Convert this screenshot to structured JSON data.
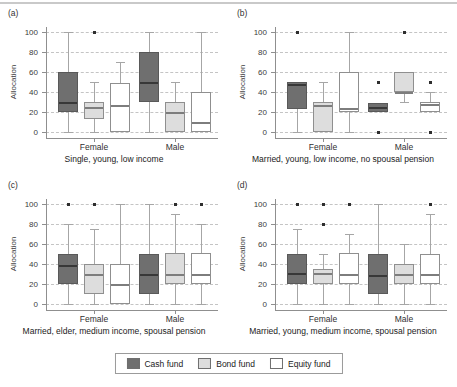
{
  "figure": {
    "ylabel": "Allocation",
    "groups": [
      "Female",
      "Male"
    ],
    "legend": [
      {
        "label": "Cash fund",
        "color": "#6f6f6f"
      },
      {
        "label": "Bond fund",
        "color": "#dddddd"
      },
      {
        "label": "Equity fund",
        "color": "#ffffff"
      }
    ]
  },
  "chart_data": {
    "type": "box",
    "ylabel": "Allocation",
    "ylim": [
      0,
      100
    ],
    "yticks": [
      0,
      20,
      40,
      60,
      80,
      100
    ],
    "grid": "dashed-horizontal",
    "legend_position": "bottom-center",
    "series": [
      "Cash fund",
      "Bond fund",
      "Equity fund"
    ],
    "groups": [
      "Female",
      "Male"
    ],
    "panels": [
      {
        "label": "(a)",
        "caption": "Single, young, low income",
        "boxes": [
          {
            "group": "Female",
            "series": "Cash fund",
            "whislo": 0,
            "q1": 20,
            "med": 30,
            "q3": 60,
            "whishi": 100,
            "outliers": []
          },
          {
            "group": "Female",
            "series": "Bond fund",
            "whislo": 0,
            "q1": 13,
            "med": 25,
            "q3": 30,
            "whishi": 50,
            "outliers": [
              100
            ]
          },
          {
            "group": "Female",
            "series": "Equity fund",
            "whislo": 0,
            "q1": 0,
            "med": 27,
            "q3": 49,
            "whishi": 70,
            "outliers": []
          },
          {
            "group": "Male",
            "series": "Cash fund",
            "whislo": 0,
            "q1": 30,
            "med": 50,
            "q3": 80,
            "whishi": 100,
            "outliers": []
          },
          {
            "group": "Male",
            "series": "Bond fund",
            "whislo": 0,
            "q1": 0,
            "med": 20,
            "q3": 30,
            "whishi": 50,
            "outliers": []
          },
          {
            "group": "Male",
            "series": "Equity fund",
            "whislo": 0,
            "q1": 0,
            "med": 10,
            "q3": 40,
            "whishi": 100,
            "outliers": []
          }
        ]
      },
      {
        "label": "(b)",
        "caption": "Married, young, low income, no spousal pension",
        "boxes": [
          {
            "group": "Female",
            "series": "Cash fund",
            "whislo": 0,
            "q1": 23,
            "med": 48,
            "q3": 50,
            "whishi": 50,
            "outliers": [
              100
            ]
          },
          {
            "group": "Female",
            "series": "Bond fund",
            "whislo": 0,
            "q1": 0,
            "med": 27,
            "q3": 30,
            "whishi": 50,
            "outliers": []
          },
          {
            "group": "Female",
            "series": "Equity fund",
            "whislo": 0,
            "q1": 20,
            "med": 24,
            "q3": 60,
            "whishi": 100,
            "outliers": []
          },
          {
            "group": "Male",
            "series": "Cash fund",
            "whislo": 20,
            "q1": 20,
            "med": 25,
            "q3": 29,
            "whishi": 29,
            "outliers": [
              50,
              0
            ]
          },
          {
            "group": "Male",
            "series": "Bond fund",
            "whislo": 30,
            "q1": 40,
            "med": 40,
            "q3": 60,
            "whishi": 60,
            "outliers": [
              100
            ]
          },
          {
            "group": "Male",
            "series": "Equity fund",
            "whislo": 20,
            "q1": 20,
            "med": 28,
            "q3": 30,
            "whishi": 40,
            "outliers": [
              50,
              0
            ]
          }
        ]
      },
      {
        "label": "(c)",
        "caption": "Married, elder, medium income, spousal pension",
        "boxes": [
          {
            "group": "Female",
            "series": "Cash fund",
            "whislo": 0,
            "q1": 20,
            "med": 39,
            "q3": 50,
            "whishi": 80,
            "outliers": [
              100
            ]
          },
          {
            "group": "Female",
            "series": "Bond fund",
            "whislo": 0,
            "q1": 10,
            "med": 30,
            "q3": 40,
            "whishi": 75,
            "outliers": [
              100
            ]
          },
          {
            "group": "Female",
            "series": "Equity fund",
            "whislo": 0,
            "q1": 0,
            "med": 20,
            "q3": 40,
            "whishi": 100,
            "outliers": []
          },
          {
            "group": "Male",
            "series": "Cash fund",
            "whislo": 0,
            "q1": 10,
            "med": 30,
            "q3": 50,
            "whishi": 100,
            "outliers": []
          },
          {
            "group": "Male",
            "series": "Bond fund",
            "whislo": 0,
            "q1": 20,
            "med": 30,
            "q3": 51,
            "whishi": 90,
            "outliers": [
              100
            ]
          },
          {
            "group": "Male",
            "series": "Equity fund",
            "whislo": 0,
            "q1": 20,
            "med": 30,
            "q3": 51,
            "whishi": 80,
            "outliers": [
              100
            ]
          }
        ]
      },
      {
        "label": "(d)",
        "caption": "Married, young, medium income, spousal pension",
        "boxes": [
          {
            "group": "Female",
            "series": "Cash fund",
            "whislo": 0,
            "q1": 20,
            "med": 31,
            "q3": 50,
            "whishi": 75,
            "outliers": [
              100
            ]
          },
          {
            "group": "Female",
            "series": "Bond fund",
            "whislo": 0,
            "q1": 20,
            "med": 31,
            "q3": 35,
            "whishi": 50,
            "outliers": [
              80,
              100
            ]
          },
          {
            "group": "Female",
            "series": "Equity fund",
            "whislo": 0,
            "q1": 20,
            "med": 30,
            "q3": 51,
            "whishi": 70,
            "outliers": [
              100
            ]
          },
          {
            "group": "Male",
            "series": "Cash fund",
            "whislo": 0,
            "q1": 10,
            "med": 29,
            "q3": 50,
            "whishi": 100,
            "outliers": []
          },
          {
            "group": "Male",
            "series": "Bond fund",
            "whislo": 0,
            "q1": 20,
            "med": 30,
            "q3": 40,
            "whishi": 60,
            "outliers": []
          },
          {
            "group": "Male",
            "series": "Equity fund",
            "whislo": 0,
            "q1": 20,
            "med": 30,
            "q3": 50,
            "whishi": 90,
            "outliers": [
              100
            ]
          }
        ]
      }
    ]
  }
}
